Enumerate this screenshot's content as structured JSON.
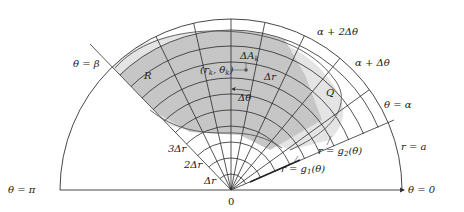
{
  "diagram": {
    "type": "polar-region-partition",
    "colors": {
      "background": "#ffffff",
      "region_fill": "#e4e4e4",
      "inner_cells_fill": "#c6c6c6",
      "line": "#333333",
      "grid_line": "#2a2a2a"
    },
    "labels": {
      "theta_beta": "θ = β",
      "theta_pi": "θ = π",
      "theta_zero": "θ = 0",
      "theta_alpha": "θ = α",
      "alpha_plus_dtheta": "α + Δθ",
      "alpha_plus_2dtheta": "α + 2Δθ",
      "region_R": "R",
      "cell_Q": "Q",
      "point": "(r",
      "point_k1": "k",
      "point_mid": ", θ",
      "point_k2": "k",
      "point_close": ")",
      "delta_A": "ΔA",
      "delta_A_sub": "k",
      "delta_r": "Δr",
      "delta_theta": "Δθ",
      "ring_1": "Δr",
      "ring_2": "2Δr",
      "ring_3": "3Δr",
      "origin": "0",
      "r_eq_a": "r = a",
      "g1_r": "r = g",
      "g1_sub": "1",
      "g1_arg": "(θ)",
      "g2_r": "r = g",
      "g2_sub": "2",
      "g2_arg": "(θ)"
    }
  }
}
